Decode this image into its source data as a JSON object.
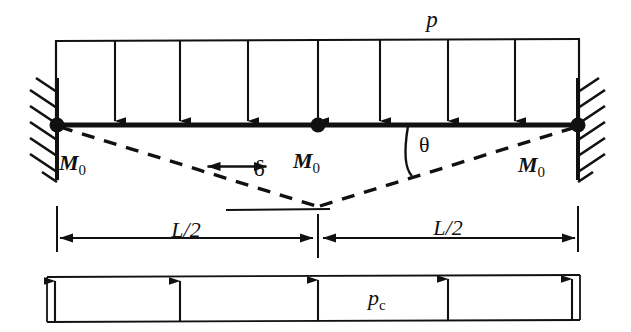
{
  "figure": {
    "stroke_color": "#111111",
    "background_color": "#ffffff"
  },
  "labels": {
    "distributed_load": "p",
    "collapse_load": "p",
    "collapse_load_subscript": "c",
    "moment_left": "M",
    "moment_left_subscript": "0",
    "moment_center": "M",
    "moment_center_subscript": "0",
    "moment_right": "M",
    "moment_right_subscript": "0",
    "deflection": "δ",
    "rotation": "θ",
    "span_left": "L/2",
    "span_right": "L/2"
  },
  "geometry": {
    "beam": {
      "x_left": 57,
      "x_right": 578,
      "y": 125
    },
    "load_line_y": 40,
    "load_arrow_x": [
      115,
      180,
      248,
      318,
      380,
      448,
      515
    ],
    "load_arrow_count": 7,
    "hinges_x": [
      57,
      318,
      578
    ],
    "hinge_radius": 7,
    "mechanism_vertex": {
      "x": 318,
      "y": 206
    },
    "deflection_arrow_x": 237,
    "deflection_top_y": 127,
    "deflection_bottom_y": 205,
    "theta_arc_x": 408,
    "dimension_line_y": 238,
    "dimension_ticks_x": [
      57,
      318,
      578
    ],
    "bottom_diagram": {
      "y_top": 277,
      "y_bottom": 322,
      "x_left": 47,
      "x_right": 580
    },
    "bottom_arrow_x": [
      55,
      180,
      318,
      448,
      572
    ],
    "bottom_arrow_count": 5,
    "wall_left_x": 57,
    "wall_right_x": 578,
    "wall_y_top": 80,
    "wall_y_bottom": 178
  },
  "annotations": {
    "mechanism_style": "dashed",
    "support_type": "fixed-end with hatching",
    "hinge_type": "plastic-hinge-filled-circle"
  }
}
